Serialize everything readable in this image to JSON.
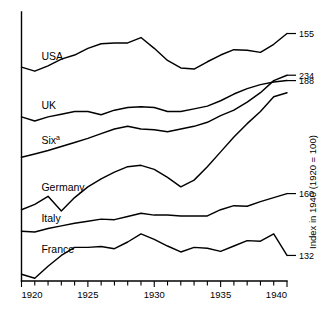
{
  "chart_data": {
    "type": "line",
    "title": "",
    "subtitle": "",
    "xlabel": "",
    "ylabel": "Index in 1940 (1920 = 100)",
    "xlim": [
      1920,
      1940
    ],
    "ylim": [
      0,
      100
    ],
    "grid": false,
    "legend_position": "inline-left",
    "x": [
      1920,
      1921,
      1922,
      1923,
      1924,
      1925,
      1926,
      1927,
      1928,
      1929,
      1930,
      1931,
      1932,
      1933,
      1934,
      1935,
      1936,
      1937,
      1938,
      1939,
      1940
    ],
    "xticks": [
      1920,
      1925,
      1930,
      1935,
      1940
    ],
    "xticklabels": [
      "1920",
      "1925",
      "1930",
      "1935",
      "1940"
    ],
    "minor_xticks_every": 1,
    "annotations": [
      "a"
    ],
    "series": [
      {
        "name": "USA",
        "label": "USA",
        "end_label": "155",
        "end_value": 155,
        "label_x": 1921.5,
        "label_y": 82.2,
        "values": [
          79.5,
          78.0,
          80.0,
          82.5,
          84.0,
          86.5,
          88.2,
          88.5,
          88.5,
          90.5,
          86.5,
          82.0,
          79.2,
          78.8,
          81.5,
          84.0,
          86.0,
          85.8,
          85.0,
          88.0,
          92.0
        ]
      },
      {
        "name": "UK",
        "label": "UK",
        "end_label": "188",
        "end_value": 188,
        "label_x": 1921.5,
        "label_y": 63.8,
        "values": [
          61.0,
          59.5,
          61.0,
          62.0,
          63.0,
          63.0,
          61.8,
          63.5,
          64.5,
          64.8,
          64.5,
          63.0,
          63.0,
          64.0,
          65.0,
          67.0,
          69.5,
          71.5,
          73.0,
          74.0,
          74.5
        ]
      },
      {
        "name": "Six",
        "label": "Six",
        "label_sup": "a",
        "end_label": "234",
        "end_value": 234,
        "label_x": 1921.5,
        "label_y": 51.0,
        "values": [
          46.0,
          47.2,
          48.5,
          50.0,
          51.5,
          53.0,
          54.8,
          56.5,
          57.5,
          56.5,
          56.2,
          55.5,
          56.5,
          57.5,
          59.0,
          61.5,
          63.5,
          66.5,
          70.0,
          74.5,
          76.5
        ]
      },
      {
        "name": "Germany",
        "label": "Germany",
        "end_label": "234",
        "label_x": 1921.5,
        "label_y": 33.5,
        "values": [
          26.5,
          28.5,
          31.5,
          26.0,
          31.0,
          35.0,
          38.0,
          40.5,
          42.5,
          43.0,
          41.5,
          38.5,
          35.0,
          37.5,
          42.5,
          48.0,
          53.5,
          58.5,
          63.0,
          68.5,
          70.0
        ]
      },
      {
        "name": "Italy",
        "label": "Italy",
        "end_label": "160",
        "end_value": 160,
        "label_x": 1921.5,
        "label_y": 22.0,
        "values": [
          18.5,
          18.2,
          19.5,
          20.5,
          21.5,
          22.2,
          23.0,
          22.8,
          24.0,
          25.2,
          24.5,
          24.5,
          24.2,
          24.2,
          24.2,
          26.5,
          28.0,
          27.8,
          29.5,
          31.0,
          32.5
        ]
      },
      {
        "name": "France",
        "label": "France",
        "end_label": "132",
        "end_value": 132,
        "label_x": 1921.5,
        "label_y": 10.5,
        "values": [
          2.5,
          1.0,
          5.5,
          9.5,
          12.5,
          12.5,
          12.8,
          12.0,
          14.5,
          17.5,
          15.5,
          13.0,
          10.8,
          12.5,
          12.2,
          11.0,
          13.0,
          15.0,
          14.8,
          17.5,
          9.5
        ]
      }
    ]
  },
  "colors": {
    "line": "#000000",
    "axis": "#000000",
    "background": "#ffffff"
  }
}
